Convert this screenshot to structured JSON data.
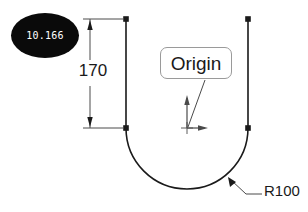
{
  "drawing": {
    "background_color": "#ffffff",
    "line_color": "#1a1a1a",
    "guide_color": "#4a4a4a",
    "callout_border_color": "#9a9a9a",
    "badge_color": "#0a0a0a",
    "badge_text_color": "#ffffff"
  },
  "badge": {
    "label": "10.166",
    "name": "score-badge"
  },
  "dimension": {
    "label": "170",
    "icon": "linear-dimension-icon"
  },
  "origin_callout": {
    "label": "Origin",
    "marker_icon": "origin-axes-icon"
  },
  "radius_callout": {
    "label": "R100",
    "leader_icon": "leader-arrow-icon"
  },
  "geometry": {
    "left_line": {
      "x": 126,
      "y_top": 19,
      "y_bottom": 128
    },
    "right_line": {
      "x": 248,
      "y_top": 19,
      "y_bottom": 128
    },
    "arc": {
      "center_x": 187,
      "center_y": 128,
      "radius": 61,
      "sweep": "180"
    },
    "nodes": [
      {
        "x": 126,
        "y": 19
      },
      {
        "x": 248,
        "y": 19
      },
      {
        "x": 126,
        "y": 128
      },
      {
        "x": 248,
        "y": 128
      }
    ],
    "origin_point": {
      "x": 187,
      "y": 128
    }
  }
}
